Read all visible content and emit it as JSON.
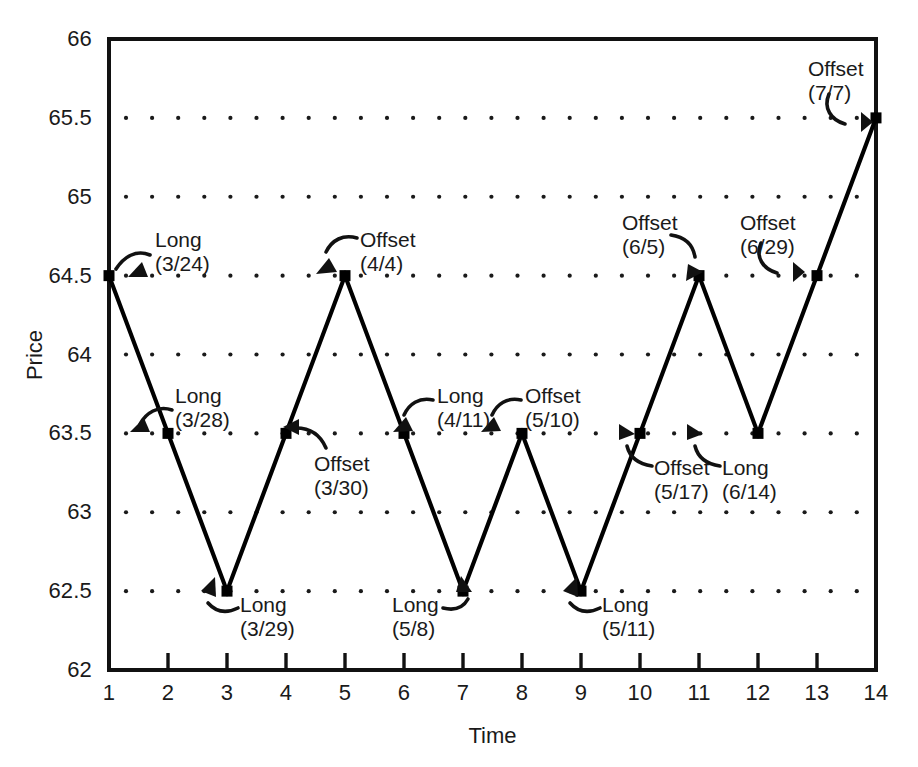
{
  "chart_data": {
    "type": "line",
    "title": "",
    "xlabel": "Time",
    "ylabel": "Price",
    "xlim": [
      1,
      14
    ],
    "ylim": [
      62,
      66
    ],
    "grid": true,
    "grid_style": "dotted",
    "legend": "none",
    "marker": "filled-square",
    "line_color": "#000000",
    "x": [
      1,
      2,
      3,
      4,
      5,
      6,
      7,
      8,
      9,
      10,
      11,
      12,
      13,
      14
    ],
    "values": [
      64.5,
      63.5,
      62.5,
      63.5,
      64.5,
      63.5,
      62.5,
      63.5,
      62.5,
      63.5,
      64.5,
      63.5,
      64.5,
      65.5
    ],
    "series": [
      {
        "name": "Price",
        "values": [
          64.5,
          63.5,
          62.5,
          63.5,
          64.5,
          63.5,
          62.5,
          63.5,
          62.5,
          63.5,
          64.5,
          63.5,
          64.5,
          65.5
        ]
      }
    ],
    "xticks": [
      "1",
      "2",
      "3",
      "4",
      "5",
      "6",
      "7",
      "8",
      "9",
      "10",
      "11",
      "12",
      "13",
      "14"
    ],
    "ytick_values": [
      62,
      62.5,
      63,
      63.5,
      64,
      64.5,
      65,
      65.5,
      66
    ],
    "yticks": [
      "62",
      "62.5",
      "63",
      "63.5",
      "64",
      "64.5",
      "65",
      "65.5",
      "66"
    ],
    "ytick_labeled": [
      "62",
      "62.5",
      "63",
      "63.5",
      "64",
      "64.5",
      "65",
      "65.5",
      "66"
    ],
    "annotations": [
      {
        "label": "Long",
        "date": "(3/24)",
        "x": 1,
        "y": 64.5
      },
      {
        "label": "Long",
        "date": "(3/28)",
        "x": 2,
        "y": 63.5
      },
      {
        "label": "Long",
        "date": "(3/29)",
        "x": 3,
        "y": 62.5
      },
      {
        "label": "Offset",
        "date": "(3/30)",
        "x": 4,
        "y": 63.5
      },
      {
        "label": "Offset",
        "date": "(4/4)",
        "x": 5,
        "y": 64.5
      },
      {
        "label": "Long",
        "date": "(4/11)",
        "x": 6,
        "y": 63.5
      },
      {
        "label": "Long",
        "date": "(5/8)",
        "x": 7,
        "y": 62.5
      },
      {
        "label": "Offset",
        "date": "(5/10)",
        "x": 8,
        "y": 63.5
      },
      {
        "label": "Long",
        "date": "(5/11)",
        "x": 9,
        "y": 62.5
      },
      {
        "label": "Offset",
        "date": "(5/17)",
        "x": 10,
        "y": 63.5
      },
      {
        "label": "Offset",
        "date": "(6/5)",
        "x": 11,
        "y": 64.5
      },
      {
        "label": "Long",
        "date": "(6/14)",
        "x": 12,
        "y": 63.5
      },
      {
        "label": "Offset",
        "date": "(6/29)",
        "x": 13,
        "y": 64.5
      },
      {
        "label": "Offset",
        "date": "(7/7)",
        "x": 14,
        "y": 65.5
      }
    ]
  },
  "annotation_layout": [
    {
      "id": "ann-long-324",
      "left": 155,
      "top": 228,
      "align": "left",
      "arrow": "m 150,255 c -14,-6 -26,2 -34,14",
      "head": "128,277 142,262 148,277"
    },
    {
      "id": "ann-long-328",
      "left": 175,
      "top": 384,
      "align": "left",
      "arrow": "m 172,410 c -14,-5 -26,3 -32,14",
      "head": "130,432 144,418 150,432"
    },
    {
      "id": "ann-long-329",
      "left": 240,
      "top": 593,
      "align": "left",
      "arrow": "m 238,608 c -12,6 -22,4 -30,-5",
      "head": "215,577 216,597 201,591"
    },
    {
      "id": "ann-offset-330",
      "left": 314,
      "top": 452,
      "align": "left",
      "arrow": "m 326,448 c -6,-14 -16,-20 -30,-20",
      "head": "283,427 299,419 299,435"
    },
    {
      "id": "ann-offset-44",
      "left": 360,
      "top": 228,
      "align": "left",
      "arrow": "m 357,238 c -14,-4 -25,2 -31,14",
      "head": "316,274 329,258 337,272"
    },
    {
      "id": "ann-long-411",
      "left": 437,
      "top": 384,
      "align": "left",
      "arrow": "m 433,400 c -14,-3 -24,4 -29,15",
      "head": "393,432 406,417 413,431"
    },
    {
      "id": "ann-long-58",
      "left": 392,
      "top": 593,
      "align": "left",
      "arrow": "m 443,608 c 12,3 20,0 25,-9",
      "head": "461,576 472,592 456,592"
    },
    {
      "id": "ann-offset-510",
      "left": 525,
      "top": 384,
      "align": "left",
      "arrow": "m 521,400 c -14,-3 -24,4 -29,15",
      "head": "481,432 494,417 501,431"
    },
    {
      "id": "ann-long-511",
      "left": 602,
      "top": 593,
      "align": "left",
      "arrow": "m 600,608 c -12,6 -22,4 -30,-5",
      "head": "577,577 578,597 563,591"
    },
    {
      "id": "ann-offset-517",
      "left": 654,
      "top": 456,
      "align": "left",
      "arrow": "m 652,466 c -14,-2 -22,-8 -25,-20",
      "head": "619,424 635,434 619,440"
    },
    {
      "id": "ann-offset-65",
      "left": 622,
      "top": 211,
      "align": "left",
      "arrow": "m 671,235 c 14,2 22,10 24,22",
      "head": "686,281 703,272 688,264"
    },
    {
      "id": "ann-long-614",
      "left": 722,
      "top": 456,
      "align": "left",
      "arrow": "m 720,466 c -14,-2 -22,-8 -25,-20",
      "head": "687,424 703,434 687,440"
    },
    {
      "id": "ann-offset-629",
      "left": 740,
      "top": 211,
      "align": "left",
      "arrow": "m 761,243 c -6,14 2,26 16,30",
      "head": "793,262 793,282 805,272"
    },
    {
      "id": "ann-offset-77",
      "left": 808,
      "top": 57,
      "align": "left",
      "arrow": "m 829,94 c -6,14 2,26 16,30",
      "head": "861,112 861,132 873,122"
    }
  ],
  "axes": {
    "ylabel_text": "Price",
    "xlabel_text": "Time"
  }
}
